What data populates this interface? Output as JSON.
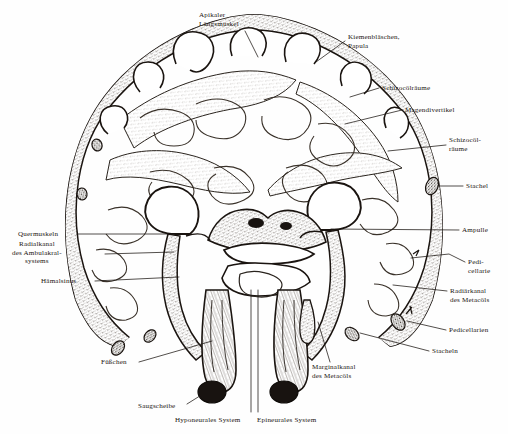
{
  "figure": {
    "background_color": "#fefefe",
    "ink_color": "#1a1410",
    "stipple_color": "#4a4038"
  },
  "labels": [
    {
      "id": "apikaler-laengsmuskel",
      "name": "apikaler-laengsmuskel-label",
      "lines": [
        "Apikaler",
        "Längsmuskel"
      ],
      "x": 199,
      "y": 11,
      "align": "left",
      "leader": [
        [
          245,
          31
        ],
        [
          258,
          57
        ]
      ]
    },
    {
      "id": "kiemenblaeschen-papula",
      "name": "kiemenblaeschen-papula-label",
      "lines": [
        "Kiemenbläschen,",
        "Papula"
      ],
      "x": 348,
      "y": 33,
      "align": "left",
      "leader": [
        [
          345,
          41
        ],
        [
          316,
          62
        ]
      ]
    },
    {
      "id": "schizocoelraeume-oben",
      "name": "schizocoelraeume-upper-label",
      "lines": [
        "Schizocölräume"
      ],
      "x": 382,
      "y": 84,
      "align": "left",
      "leader": [
        [
          379,
          88
        ],
        [
          350,
          97
        ]
      ]
    },
    {
      "id": "magendivertikel",
      "name": "magendivertikel-label",
      "lines": [
        "Magendivertikel"
      ],
      "x": 405,
      "y": 106,
      "align": "left",
      "leader": [
        [
          402,
          110
        ],
        [
          345,
          124
        ]
      ]
    },
    {
      "id": "schizocoelraeume-unten",
      "name": "schizocoelraeume-lower-label",
      "lines": [
        "Schizocöl-",
        "räume"
      ],
      "x": 449,
      "y": 136,
      "align": "left",
      "leader": [
        [
          446,
          145
        ],
        [
          388,
          151
        ]
      ]
    },
    {
      "id": "stachel",
      "name": "stachel-label",
      "lines": [
        "Stachel"
      ],
      "x": 466,
      "y": 182,
      "align": "left",
      "leader": [
        [
          463,
          186
        ],
        [
          439,
          186
        ]
      ]
    },
    {
      "id": "ampulle",
      "name": "ampulle-label",
      "lines": [
        "Ampulle"
      ],
      "x": 462,
      "y": 226,
      "align": "left",
      "leader": [
        [
          459,
          230
        ],
        [
          331,
          229
        ]
      ]
    },
    {
      "id": "pedicellarie",
      "name": "pedicellarie-label",
      "lines": [
        "Pedi-",
        "cellarie"
      ],
      "x": 468,
      "y": 258,
      "align": "left",
      "leader": [
        [
          465,
          262
        ],
        [
          449,
          254
        ],
        [
          411,
          258
        ]
      ]
    },
    {
      "id": "radiaerkanal-metacoels",
      "name": "radiaerkanal-des-metacoels-label",
      "lines": [
        "Radiärkanal",
        "des Metacöls"
      ],
      "x": 450,
      "y": 287,
      "align": "left",
      "leader": [
        [
          447,
          291
        ],
        [
          393,
          285
        ]
      ]
    },
    {
      "id": "pedicellarien",
      "name": "pedicellarien-label",
      "lines": [
        "Pedicellarien"
      ],
      "x": 449,
      "y": 326,
      "align": "left",
      "leader": [
        [
          446,
          330
        ],
        [
          407,
          321
        ]
      ]
    },
    {
      "id": "stacheln",
      "name": "stacheln-label",
      "lines": [
        "Stacheln"
      ],
      "x": 432,
      "y": 347,
      "align": "left",
      "leader": [
        [
          429,
          351
        ],
        [
          360,
          333
        ]
      ]
    },
    {
      "id": "quermuskeln",
      "name": "quermuskeln-label",
      "lines": [
        "Quermuskeln"
      ],
      "x": 18,
      "y": 230,
      "align": "left",
      "leader": [
        [
          77,
          234
        ],
        [
          172,
          234
        ]
      ]
    },
    {
      "id": "radialkanal-ambulakralsystems",
      "name": "radialkanal-des-ambulakralsystems-label",
      "lines": [
        "Radialkanal",
        "des Ambulakral-",
        "systems"
      ],
      "x": 12,
      "y": 240,
      "align": "center",
      "leader": [
        [
          105,
          254
        ],
        [
          174,
          252
        ]
      ]
    },
    {
      "id": "haemalsinus",
      "name": "haemalsinus-label",
      "lines": [
        "Hämalsinus"
      ],
      "x": 41,
      "y": 277,
      "align": "left",
      "leader": [
        [
          95,
          281
        ],
        [
          179,
          277
        ]
      ]
    },
    {
      "id": "fuesschen",
      "name": "fuesschen-label",
      "lines": [
        "Füßchen"
      ],
      "x": 101,
      "y": 358,
      "align": "left",
      "leader": [
        [
          139,
          362
        ],
        [
          212,
          341
        ]
      ]
    },
    {
      "id": "saugscheibe",
      "name": "saugscheibe-label",
      "lines": [
        "Saugscheibe"
      ],
      "x": 138,
      "y": 402,
      "align": "left",
      "leader": [
        [
          187,
          404
        ],
        [
          203,
          394
        ]
      ]
    },
    {
      "id": "hyponeurales-system",
      "name": "hyponeurales-system-label",
      "lines": [
        "Hyponeurales System"
      ],
      "x": 175,
      "y": 416,
      "align": "left",
      "leader": [
        [
          251,
          415
        ],
        [
          251,
          290
        ]
      ]
    },
    {
      "id": "epineurales-system",
      "name": "epineurales-system-label",
      "lines": [
        "Epineurales System"
      ],
      "x": 257,
      "y": 416,
      "align": "left",
      "leader": [
        [
          255,
          415
        ],
        [
          255,
          290
        ]
      ]
    },
    {
      "id": "marginalkanal-metacoels",
      "name": "marginalkanal-des-metacoels-label",
      "lines": [
        "Marginalkanal",
        "des Metacöls"
      ],
      "x": 312,
      "y": 363,
      "align": "left",
      "leader": [
        [
          330,
          363
        ],
        [
          316,
          320
        ]
      ]
    }
  ]
}
